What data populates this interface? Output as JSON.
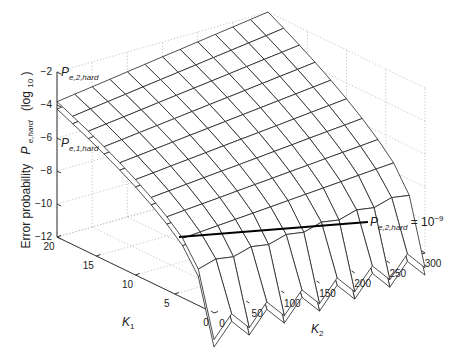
{
  "chart_data": {
    "type": "surface3d",
    "title": "",
    "xlabel": "K_2",
    "ylabel": "K_1",
    "zlabel": "Error probability P_e,hard (log_10)",
    "x_axis": {
      "label": "K",
      "subscript": "2",
      "ticks": [
        0,
        50,
        100,
        150,
        200,
        250,
        300
      ],
      "range": [
        0,
        300
      ]
    },
    "y_axis": {
      "label": "K",
      "subscript": "1",
      "ticks": [
        0,
        5,
        10,
        15,
        20
      ],
      "range": [
        0,
        20
      ]
    },
    "z_axis": {
      "label_main": "Error probability",
      "label_sym": "P",
      "label_sub": "e,hard",
      "label_unit": "(log",
      "label_unit_sub": "10",
      "label_unit_close": ")",
      "ticks": [
        -12,
        -10,
        -8,
        -6,
        -4,
        -2
      ],
      "range": [
        -12,
        -2
      ]
    },
    "grid": true,
    "series": [
      {
        "name": "P_e,2,hard",
        "label_sym": "P",
        "label_sub": "e,2,hard",
        "description": "upper mesh surface, approx log10 error prob; ~-3.7 at K1=20,K2=0 rising to ~-2 at K1=20,K2=300, falling toward ~-12 at small K1"
      },
      {
        "name": "P_e,1,hard",
        "label_sym": "P",
        "label_sub": "e,1,hard",
        "description": "second mesh surface slightly below/offset from P_e,2,hard"
      }
    ],
    "annotation": {
      "sym": "P",
      "sub": "e,2,hard",
      "text": " = 10",
      "sup": "−9",
      "line": {
        "from": {
          "K1": 0,
          "K2": 0,
          "z": -9
        },
        "to": {
          "K1": 0,
          "K2": 240,
          "z": -9
        },
        "style": "thick black"
      }
    }
  }
}
